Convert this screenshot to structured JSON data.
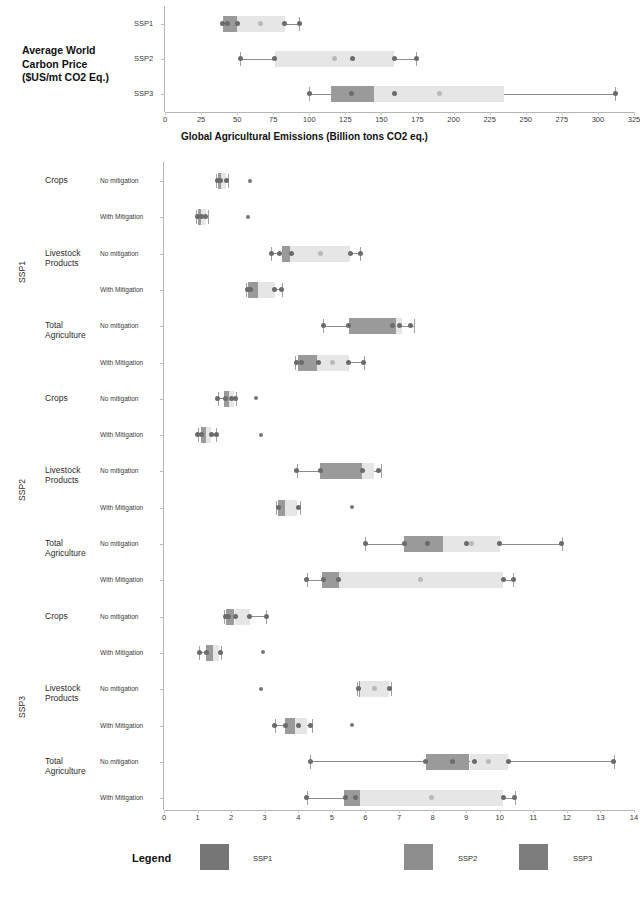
{
  "figure": {
    "top_title": "Average World\nCarbon Price\n($US/mt CO2 Eq.)",
    "axis_title": "Global Agricultural Emissions (Billion tons CO2 eq.)"
  },
  "legend": {
    "title": "Legend",
    "items": [
      {
        "label": "SSP1",
        "color": "#767676"
      },
      {
        "label": "SSP2",
        "color": "#8e8e8e"
      },
      {
        "label": "SSP3",
        "color": "#7d7d7d"
      }
    ]
  },
  "chart_data": [
    {
      "type": "box",
      "id": "carbon-price",
      "title": "Average World Carbon Price ($US/mt CO2 Eq.)",
      "xlabel": "",
      "ylabel": "",
      "xlim": [
        0,
        325
      ],
      "xticks": [
        0,
        25,
        50,
        75,
        100,
        125,
        150,
        175,
        200,
        225,
        250,
        275,
        300,
        325
      ],
      "grid": false,
      "categories": [
        "SSP1",
        "SSP2",
        "SSP3"
      ],
      "boxes": [
        {
          "category": "SSP1",
          "whisker_low": 40,
          "q1": 40,
          "median": 50,
          "q3": 83,
          "whisker_high": 93,
          "points": [
            40,
            43,
            50,
            83,
            93
          ]
        },
        {
          "category": "SSP2",
          "whisker_low": 52,
          "q1": 76,
          "median": 76,
          "q3": 159,
          "whisker_high": 174,
          "points": [
            52,
            76,
            130,
            159,
            174
          ]
        },
        {
          "category": "SSP3",
          "whisker_low": 100,
          "q1": 115,
          "median": 145,
          "q3": 235,
          "whisker_high": 312,
          "points": [
            100,
            129,
            159,
            312
          ]
        }
      ]
    },
    {
      "type": "box",
      "id": "agricultural-emissions",
      "title": "Global Agricultural Emissions (Billion tons CO2 eq.)",
      "xlabel": "Global Agricultural Emissions (Billion tons CO2 eq.)",
      "ylabel": "",
      "xlim": [
        0,
        14
      ],
      "xticks": [
        0,
        1,
        2,
        3,
        4,
        5,
        6,
        7,
        8,
        9,
        10,
        11,
        12,
        13,
        14
      ],
      "grid": false,
      "groups": [
        {
          "ssp": "SSP1",
          "sectors": [
            {
              "sector": "Crops",
              "rows": [
                {
                  "mitigation": "No mitigation",
                  "whisker_low": 1.55,
                  "q1": 1.6,
                  "median": 1.7,
                  "q3": 1.85,
                  "whisker_high": 1.9,
                  "points": [
                    1.6,
                    1.67,
                    1.85
                  ],
                  "outliers": [
                    2.55
                  ]
                },
                {
                  "mitigation": "With Mitigation",
                  "whisker_low": 0.95,
                  "q1": 1.0,
                  "median": 1.1,
                  "q3": 1.25,
                  "whisker_high": 1.3,
                  "points": [
                    1.0,
                    1.12,
                    1.25
                  ],
                  "outliers": [
                    2.5
                  ]
                }
              ]
            },
            {
              "sector": "Livestock\nProducts",
              "rows": [
                {
                  "mitigation": "No mitigation",
                  "whisker_low": 3.2,
                  "q1": 3.5,
                  "median": 3.75,
                  "q3": 5.55,
                  "whisker_high": 5.85,
                  "points": [
                    3.2,
                    3.45,
                    3.8,
                    5.55,
                    5.85
                  ],
                  "outliers": []
                },
                {
                  "mitigation": "With Mitigation",
                  "whisker_low": 2.45,
                  "q1": 2.5,
                  "median": 2.8,
                  "q3": 3.3,
                  "whisker_high": 3.5,
                  "points": [
                    2.5,
                    2.58,
                    3.3,
                    3.5
                  ],
                  "outliers": []
                }
              ]
            },
            {
              "sector": "Total\nAgriculture",
              "rows": [
                {
                  "mitigation": "No mitigation",
                  "whisker_low": 4.75,
                  "q1": 5.5,
                  "median": 6.9,
                  "q3": 7.1,
                  "whisker_high": 7.45,
                  "points": [
                    4.75,
                    5.5,
                    6.8,
                    7.0,
                    7.35
                  ],
                  "outliers": []
                },
                {
                  "mitigation": "With Mitigation",
                  "whisker_low": 3.9,
                  "q1": 4.0,
                  "median": 4.55,
                  "q3": 5.5,
                  "whisker_high": 5.95,
                  "points": [
                    3.95,
                    4.1,
                    4.6,
                    5.5,
                    5.95
                  ],
                  "outliers": []
                }
              ]
            }
          ]
        },
        {
          "ssp": "SSP2",
          "sectors": [
            {
              "sector": "Crops",
              "rows": [
                {
                  "mitigation": "No mitigation",
                  "whisker_low": 1.6,
                  "q1": 1.8,
                  "median": 1.95,
                  "q3": 2.1,
                  "whisker_high": 2.15,
                  "points": [
                    1.6,
                    1.82,
                    2.0,
                    2.12
                  ],
                  "outliers": [
                    2.75
                  ]
                },
                {
                  "mitigation": "With Mitigation",
                  "whisker_low": 1.0,
                  "q1": 1.1,
                  "median": 1.25,
                  "q3": 1.4,
                  "whisker_high": 1.55,
                  "points": [
                    1.0,
                    1.12,
                    1.4,
                    1.55
                  ],
                  "outliers": [
                    2.9
                  ]
                }
              ]
            },
            {
              "sector": "Livestock\nProducts",
              "rows": [
                {
                  "mitigation": "No mitigation",
                  "whisker_low": 3.95,
                  "q1": 4.65,
                  "median": 5.9,
                  "q3": 6.25,
                  "whisker_high": 6.45,
                  "points": [
                    3.95,
                    4.65,
                    5.9,
                    6.4
                  ],
                  "outliers": []
                },
                {
                  "mitigation": "With Mitigation",
                  "whisker_low": 3.35,
                  "q1": 3.4,
                  "median": 3.6,
                  "q3": 3.95,
                  "whisker_high": 4.05,
                  "points": [
                    3.4,
                    4.0
                  ],
                  "outliers": [
                    5.6
                  ]
                }
              ]
            },
            {
              "sector": "Total\nAgriculture",
              "rows": [
                {
                  "mitigation": "No mitigation",
                  "whisker_low": 6.0,
                  "q1": 7.15,
                  "median": 8.3,
                  "q3": 10.0,
                  "whisker_high": 11.85,
                  "points": [
                    6.0,
                    7.15,
                    7.85,
                    9.0,
                    10.0,
                    11.85
                  ],
                  "outliers": []
                },
                {
                  "mitigation": "With Mitigation",
                  "whisker_low": 4.25,
                  "q1": 4.7,
                  "median": 5.2,
                  "q3": 10.1,
                  "whisker_high": 10.4,
                  "points": [
                    4.25,
                    4.75,
                    5.2,
                    10.1,
                    10.4
                  ],
                  "outliers": []
                }
              ]
            }
          ]
        },
        {
          "ssp": "SSP3",
          "sectors": [
            {
              "sector": "Crops",
              "rows": [
                {
                  "mitigation": "No mitigation",
                  "whisker_low": 1.8,
                  "q1": 1.85,
                  "median": 2.1,
                  "q3": 2.55,
                  "whisker_high": 3.05,
                  "points": [
                    1.82,
                    1.93,
                    2.12,
                    2.55,
                    3.05
                  ],
                  "outliers": []
                },
                {
                  "mitigation": "With Mitigation",
                  "whisker_low": 1.05,
                  "q1": 1.25,
                  "median": 1.45,
                  "q3": 1.65,
                  "whisker_high": 1.7,
                  "points": [
                    1.05,
                    1.28,
                    1.68
                  ],
                  "outliers": [
                    2.95
                  ]
                }
              ]
            },
            {
              "sector": "Livestock\nProducts",
              "rows": [
                {
                  "mitigation": "No mitigation",
                  "whisker_low": 5.75,
                  "q1": 5.8,
                  "median": 5.85,
                  "q3": 6.7,
                  "whisker_high": 6.75,
                  "points": [
                    5.8,
                    6.72
                  ],
                  "outliers": [
                    2.9
                  ]
                },
                {
                  "mitigation": "With Mitigation",
                  "whisker_low": 3.3,
                  "q1": 3.6,
                  "median": 3.9,
                  "q3": 4.25,
                  "whisker_high": 4.4,
                  "points": [
                    3.3,
                    3.62,
                    4.0,
                    4.35
                  ],
                  "outliers": [
                    5.6
                  ]
                }
              ]
            },
            {
              "sector": "Total\nAgriculture",
              "rows": [
                {
                  "mitigation": "No mitigation",
                  "whisker_low": 4.35,
                  "q1": 7.8,
                  "median": 9.1,
                  "q3": 10.25,
                  "whisker_high": 13.4,
                  "points": [
                    4.35,
                    7.8,
                    8.6,
                    9.25,
                    10.25,
                    13.4
                  ],
                  "outliers": []
                },
                {
                  "mitigation": "With Mitigation",
                  "whisker_low": 4.25,
                  "q1": 5.35,
                  "median": 5.85,
                  "q3": 10.1,
                  "whisker_high": 10.45,
                  "points": [
                    4.25,
                    5.4,
                    5.7,
                    10.1,
                    10.45
                  ],
                  "outliers": []
                }
              ]
            }
          ]
        }
      ]
    }
  ]
}
